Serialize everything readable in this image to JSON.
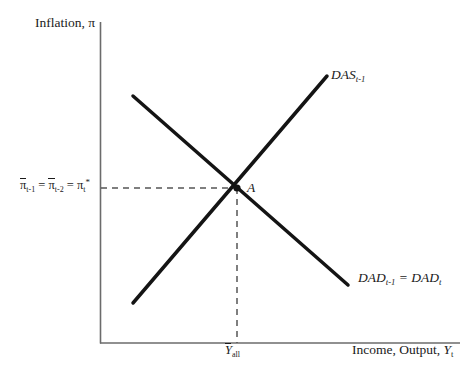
{
  "figure": {
    "background_color": "#ffffff",
    "ink_color": "#1a1a1a"
  },
  "axes": {
    "y_title": "Inflation, π",
    "x_title_prefix": "Income, Output, ",
    "x_title_symbol": "Y",
    "x_title_subscript": "t",
    "origin": {
      "x": 100,
      "y": 343
    },
    "y_axis_top": 22,
    "x_axis_right": 460
  },
  "curves": [
    {
      "id": "das",
      "label_main": "DAS",
      "label_subscript": "t-1",
      "slope": "upward",
      "from": {
        "x": 133,
        "y": 303
      },
      "to": {
        "x": 327,
        "y": 76
      }
    },
    {
      "id": "dad",
      "label_main_1": "DAD",
      "label_subscript_1": "t-1",
      "label_equals": " = ",
      "label_main_2": "DAD",
      "label_subscript_2": "t",
      "slope": "downward",
      "from": {
        "x": 133,
        "y": 96
      },
      "to": {
        "x": 348,
        "y": 285
      }
    }
  ],
  "equilibrium": {
    "point_label": "A",
    "x": 237,
    "y": 188,
    "inflation_label": {
      "symbol_1": "π",
      "subscript_1": "t-1",
      "equals_1": " = ",
      "symbol_2": "π",
      "subscript_2": "t-2",
      "equals_2": " = ",
      "symbol_3": "π",
      "subscript_3": "t",
      "superscript_3": "*"
    },
    "output_label": {
      "symbol": "Y",
      "subscript": "all",
      "has_overbar": true
    },
    "guide_lines": {
      "horizontal_dashed": true,
      "vertical_dashed": true,
      "dash_pattern": "6,5"
    }
  }
}
